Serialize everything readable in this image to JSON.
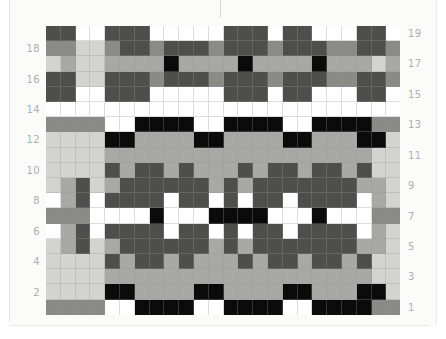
{
  "document": {
    "type": "weaving-pattern-chart",
    "description": "Greyscale woven colour-and-weave pattern draft grid"
  },
  "chart_data": {
    "type": "heatmap",
    "title": "",
    "xlabel": "",
    "ylabel": "",
    "rows": 19,
    "columns": 24,
    "grid": true,
    "legend": "none",
    "palette": {
      "W": "#ffffff",
      "L": "#d3d3cf",
      "M": "#a8a8a4",
      "D": "#8a8a86",
      "X": "#4e4e4c",
      "K": "#0b0b0b"
    },
    "palette_names": {
      "W": "white",
      "L": "light-grey",
      "M": "medium-grey",
      "D": "dark-grey",
      "X": "charcoal",
      "K": "black"
    },
    "row_labels_left": [
      "18",
      "16",
      "14",
      "12",
      "10",
      "8",
      "6",
      "4",
      "2"
    ],
    "row_labels_right": [
      "19",
      "17",
      "15",
      "13",
      "11",
      "9",
      "7",
      "5",
      "3",
      "1"
    ],
    "row_numbers_top_to_bottom": [
      19,
      18,
      17,
      16,
      15,
      14,
      13,
      12,
      11,
      10,
      9,
      8,
      7,
      6,
      5,
      4,
      3,
      2,
      1
    ],
    "cells": [
      [
        "X",
        "X",
        "W",
        "W",
        "X",
        "X",
        "X",
        "W",
        "W",
        "W",
        "W",
        "W",
        "X",
        "X",
        "X",
        "W",
        "X",
        "X",
        "W",
        "W",
        "W",
        "X",
        "X",
        "W"
      ],
      [
        "D",
        "D",
        "L",
        "L",
        "D",
        "X",
        "X",
        "D",
        "X",
        "X",
        "X",
        "D",
        "X",
        "X",
        "X",
        "D",
        "X",
        "X",
        "X",
        "D",
        "D",
        "X",
        "X",
        "D"
      ],
      [
        "L",
        "M",
        "L",
        "L",
        "M",
        "M",
        "M",
        "M",
        "K",
        "M",
        "M",
        "M",
        "M",
        "K",
        "M",
        "M",
        "M",
        "M",
        "K",
        "M",
        "M",
        "M",
        "L",
        "M"
      ],
      [
        "X",
        "X",
        "L",
        "L",
        "X",
        "X",
        "X",
        "D",
        "X",
        "X",
        "X",
        "D",
        "X",
        "X",
        "X",
        "D",
        "X",
        "X",
        "X",
        "D",
        "D",
        "X",
        "X",
        "D"
      ],
      [
        "X",
        "X",
        "W",
        "W",
        "X",
        "X",
        "X",
        "W",
        "W",
        "W",
        "W",
        "W",
        "X",
        "X",
        "X",
        "W",
        "X",
        "X",
        "W",
        "W",
        "W",
        "X",
        "X",
        "W"
      ],
      [
        "W",
        "W",
        "W",
        "W",
        "W",
        "W",
        "W",
        "W",
        "W",
        "W",
        "W",
        "W",
        "W",
        "W",
        "W",
        "W",
        "W",
        "W",
        "W",
        "W",
        "W",
        "W",
        "W",
        "W"
      ],
      [
        "D",
        "D",
        "D",
        "D",
        "W",
        "W",
        "K",
        "K",
        "K",
        "K",
        "W",
        "W",
        "K",
        "K",
        "K",
        "K",
        "W",
        "W",
        "K",
        "K",
        "K",
        "K",
        "D",
        "D"
      ],
      [
        "L",
        "L",
        "L",
        "L",
        "K",
        "K",
        "M",
        "M",
        "M",
        "M",
        "K",
        "K",
        "M",
        "M",
        "M",
        "M",
        "K",
        "K",
        "M",
        "M",
        "M",
        "K",
        "K",
        "L"
      ],
      [
        "L",
        "L",
        "L",
        "L",
        "M",
        "M",
        "M",
        "M",
        "M",
        "M",
        "M",
        "M",
        "M",
        "M",
        "M",
        "M",
        "M",
        "M",
        "M",
        "M",
        "M",
        "M",
        "L",
        "L"
      ],
      [
        "L",
        "L",
        "L",
        "L",
        "X",
        "M",
        "X",
        "X",
        "M",
        "X",
        "M",
        "M",
        "M",
        "X",
        "M",
        "X",
        "X",
        "M",
        "X",
        "X",
        "M",
        "X",
        "L",
        "L"
      ],
      [
        "L",
        "M",
        "X",
        "L",
        "M",
        "X",
        "X",
        "X",
        "X",
        "X",
        "X",
        "M",
        "X",
        "M",
        "X",
        "X",
        "X",
        "X",
        "X",
        "X",
        "X",
        "M",
        "M",
        "L"
      ],
      [
        "W",
        "M",
        "X",
        "W",
        "X",
        "X",
        "X",
        "X",
        "W",
        "X",
        "X",
        "W",
        "X",
        "W",
        "X",
        "X",
        "W",
        "X",
        "X",
        "X",
        "X",
        "W",
        "M",
        "L"
      ],
      [
        "D",
        "D",
        "D",
        "W",
        "W",
        "W",
        "W",
        "K",
        "W",
        "W",
        "W",
        "K",
        "K",
        "K",
        "K",
        "W",
        "W",
        "W",
        "K",
        "W",
        "W",
        "W",
        "D",
        "D"
      ],
      [
        "W",
        "M",
        "X",
        "W",
        "X",
        "X",
        "X",
        "X",
        "W",
        "X",
        "X",
        "W",
        "X",
        "W",
        "X",
        "X",
        "W",
        "X",
        "X",
        "X",
        "X",
        "W",
        "M",
        "L"
      ],
      [
        "L",
        "M",
        "X",
        "L",
        "M",
        "X",
        "X",
        "X",
        "X",
        "X",
        "X",
        "M",
        "X",
        "M",
        "X",
        "X",
        "X",
        "X",
        "X",
        "X",
        "X",
        "M",
        "M",
        "L"
      ],
      [
        "L",
        "L",
        "L",
        "L",
        "X",
        "M",
        "X",
        "X",
        "M",
        "X",
        "M",
        "M",
        "M",
        "X",
        "M",
        "X",
        "X",
        "M",
        "X",
        "X",
        "M",
        "X",
        "L",
        "L"
      ],
      [
        "L",
        "L",
        "L",
        "L",
        "M",
        "M",
        "M",
        "M",
        "M",
        "M",
        "M",
        "M",
        "M",
        "M",
        "M",
        "M",
        "M",
        "M",
        "M",
        "M",
        "M",
        "M",
        "L",
        "L"
      ],
      [
        "L",
        "L",
        "L",
        "L",
        "K",
        "K",
        "M",
        "M",
        "M",
        "M",
        "K",
        "K",
        "M",
        "M",
        "M",
        "M",
        "K",
        "K",
        "M",
        "M",
        "M",
        "K",
        "K",
        "L"
      ],
      [
        "D",
        "D",
        "D",
        "D",
        "W",
        "W",
        "K",
        "K",
        "K",
        "K",
        "W",
        "W",
        "K",
        "K",
        "K",
        "K",
        "W",
        "W",
        "K",
        "K",
        "K",
        "K",
        "D",
        "D"
      ]
    ]
  }
}
